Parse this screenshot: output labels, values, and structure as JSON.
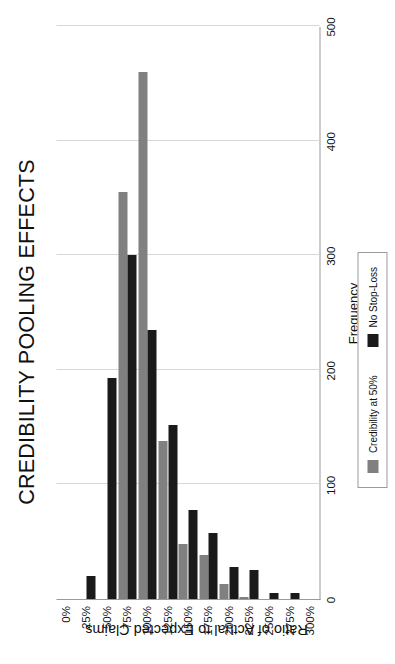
{
  "chart_data": {
    "type": "bar",
    "orientation": "horizontal",
    "title": "CREDIBILITY POOLING EFFECTS",
    "xlabel": "Ratio of Actual to Expected Claims",
    "ylabel": "Frequency",
    "categories": [
      "0%",
      "25%",
      "50%",
      "75%",
      "100%",
      "125%",
      "150%",
      "175%",
      "200%",
      "225%",
      "250%",
      "275%",
      "300%"
    ],
    "ylim": [
      0,
      500
    ],
    "yticks": [
      0,
      100,
      200,
      300,
      400,
      500
    ],
    "grid": true,
    "legend_position": "bottom",
    "series": [
      {
        "name": "Credibility at 50%",
        "color": "#808080",
        "values": [
          0,
          0,
          0,
          355,
          460,
          138,
          48,
          38,
          13,
          2,
          0,
          0,
          0
        ]
      },
      {
        "name": "No Stop-Loss",
        "color": "#1a1a1a",
        "values": [
          0,
          20,
          193,
          300,
          235,
          152,
          78,
          58,
          28,
          25,
          5,
          5,
          0
        ]
      }
    ]
  },
  "axis": {
    "value_tick_labels": [
      "0",
      "100",
      "200",
      "300",
      "400",
      "500"
    ],
    "value_axis_title": "Frequency",
    "category_axis_title": "Ratio of Actual to Expected Claims"
  },
  "legend": {
    "items": [
      {
        "label": "Credibility at 50%",
        "color": "#808080",
        "swatch": "gray-square-icon"
      },
      {
        "label": "No Stop-Loss",
        "color": "#1a1a1a",
        "swatch": "black-square-icon"
      }
    ]
  }
}
